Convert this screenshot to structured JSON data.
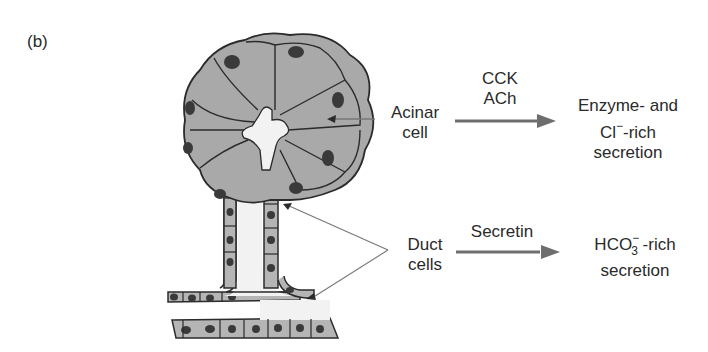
{
  "panel_label": "(b)",
  "acinar": {
    "label_line1": "Acinar",
    "label_line2": "cell",
    "stimuli_line1": "CCK",
    "stimuli_line2": "ACh",
    "output_line1": "Enzyme- and",
    "output_line2_prefix": "Cl",
    "output_line2_sup": "−",
    "output_line2_suffix": "-rich",
    "output_line3": "secretion"
  },
  "duct": {
    "label_line1": "Duct",
    "label_line2": "cells",
    "stimulus": "Secretin",
    "output_line1_prefix": "HCO",
    "output_line1_sub": "3",
    "output_line1_sup": "−",
    "output_line1_suffix": " -rich",
    "output_line2": "secretion"
  },
  "colors": {
    "cell_fill": "#a9a9a9",
    "cell_outline": "#2b2b2b",
    "nucleus": "#3a3a3a",
    "lumen": "#f2f2f2",
    "arrow": "#6e6e6e",
    "pointer_line": "#777777"
  }
}
